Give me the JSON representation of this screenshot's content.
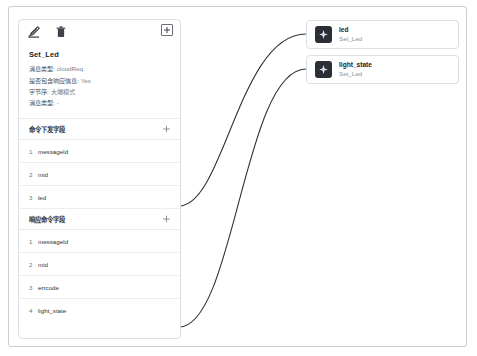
{
  "canvas": {
    "background_color": "#ffffff",
    "border_color": "#c9ccd1"
  },
  "panel": {
    "toolbar": {
      "edit_icon": "edit-square-icon",
      "delete_icon": "trash-icon",
      "add_icon": "plus-box-icon"
    },
    "title": "Set_Led",
    "properties": [
      {
        "key": "消息类型:",
        "value": "cloudReq"
      },
      {
        "key": "是否包含响应信息:",
        "value": "Yes"
      },
      {
        "key": "字节序:",
        "value": "大端模式"
      },
      {
        "key": "消息类型:",
        "value": "-"
      }
    ],
    "sections": [
      {
        "label": "命令下发字段",
        "add_icon": "plus-icon",
        "fields": [
          {
            "index": "1",
            "name": "messageId"
          },
          {
            "index": "2",
            "name": "mid"
          },
          {
            "index": "3",
            "name": "led"
          }
        ]
      },
      {
        "label": "响应命令字段",
        "add_icon": "plus-icon",
        "fields": [
          {
            "index": "1",
            "name": "messageId"
          },
          {
            "index": "2",
            "name": "mid"
          },
          {
            "index": "3",
            "name": "errcode"
          },
          {
            "index": "4",
            "name": "light_state"
          }
        ]
      }
    ]
  },
  "nodes": [
    {
      "title": "led",
      "subtitle": "Set_Led",
      "icon": "diamond-node-icon",
      "icon_bg": "#2b2f36"
    },
    {
      "title": "light_state",
      "subtitle": "Set_Led",
      "icon": "diamond-node-icon",
      "icon_bg": "#2b2f36"
    }
  ],
  "edges": {
    "color": "#2f3338",
    "connections": [
      {
        "from": "led-field",
        "to": "led-node"
      },
      {
        "from": "light_state-field",
        "to": "light_state-node"
      }
    ]
  }
}
